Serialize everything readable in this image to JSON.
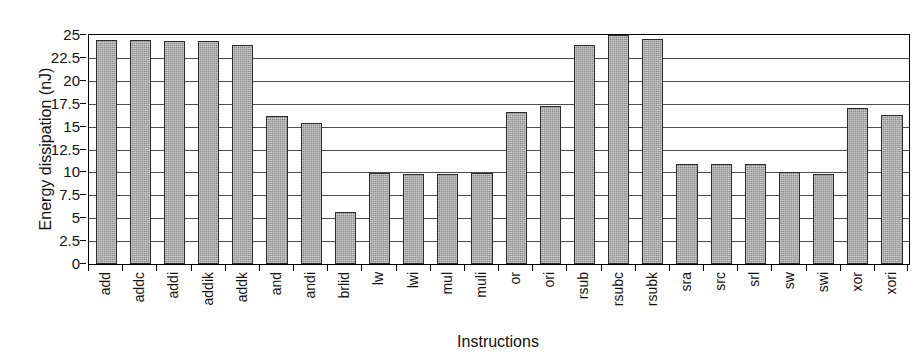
{
  "chart_data": {
    "type": "bar",
    "title": "",
    "xlabel": "Instructions",
    "ylabel": "Energy dissipation (nJ)",
    "ylim": [
      0,
      25
    ],
    "ytick_step": 2.5,
    "yticks": [
      "25",
      "22.5",
      "20",
      "17.5",
      "15",
      "12.5",
      "10",
      "7.5",
      "5",
      "2.5",
      "0"
    ],
    "ytick_values": [
      25,
      22.5,
      20,
      17.5,
      15,
      12.5,
      10,
      7.5,
      5,
      2.5,
      0
    ],
    "grid": true,
    "legend": "none",
    "bar_color": "#8c8c8c",
    "bar_edge_color": "#2b2b2b",
    "axis_color": "#000000",
    "categories": [
      "add",
      "addc",
      "addi",
      "addik",
      "addk",
      "and",
      "andi",
      "brlid",
      "lw",
      "lwi",
      "mul",
      "muli",
      "or",
      "ori",
      "rsub",
      "rsubc",
      "rsubk",
      "sra",
      "src",
      "srl",
      "sw",
      "swi",
      "xor",
      "xori"
    ],
    "values": [
      24.5,
      24.5,
      24.4,
      24.4,
      23.9,
      16.2,
      15.4,
      5.7,
      9.9,
      9.8,
      9.8,
      9.9,
      16.6,
      17.3,
      23.9,
      25.0,
      24.6,
      10.9,
      10.9,
      10.9,
      10.0,
      9.8,
      17.0,
      16.3
    ]
  }
}
